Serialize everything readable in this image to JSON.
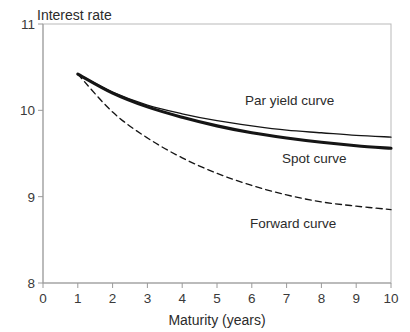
{
  "chart_data": {
    "type": "line",
    "title": "",
    "xlabel": "Maturity (years)",
    "ylabel": "Interest rate",
    "xlim": [
      0,
      10
    ],
    "ylim": [
      8,
      11
    ],
    "xticks": [
      "0",
      "1",
      "2",
      "3",
      "4",
      "5",
      "6",
      "7",
      "8",
      "9",
      "10"
    ],
    "yticks": [
      "8",
      "9",
      "10",
      "11"
    ],
    "grid": false,
    "legend_position": "inline-annotations",
    "x": [
      1,
      2,
      3,
      4,
      5,
      6,
      7,
      8,
      9,
      10
    ],
    "series": [
      {
        "name": "Par yield curve",
        "style": "thin-solid",
        "values": [
          10.42,
          10.21,
          10.06,
          9.96,
          9.88,
          9.82,
          9.77,
          9.74,
          9.71,
          9.69
        ]
      },
      {
        "name": "Spot curve",
        "style": "thick-solid",
        "values": [
          10.42,
          10.2,
          10.04,
          9.92,
          9.82,
          9.74,
          9.68,
          9.63,
          9.59,
          9.56
        ]
      },
      {
        "name": "Forward curve",
        "style": "dashed",
        "values": [
          10.42,
          9.98,
          9.68,
          9.45,
          9.27,
          9.13,
          9.02,
          8.94,
          8.89,
          8.85
        ]
      }
    ],
    "annotations": [
      {
        "text": "Par yield curve",
        "x_px": 245,
        "y_px": 105,
        "for_series": "Par yield curve"
      },
      {
        "text": "Spot curve",
        "x_px": 282,
        "y_px": 163,
        "for_series": "Spot curve"
      },
      {
        "text": "Forward curve",
        "x_px": 250,
        "y_px": 228,
        "for_series": "Forward curve"
      }
    ],
    "colors": {
      "curve": "#151515",
      "axis": "#9a9a9a",
      "frame": "#b9b9b9",
      "text": "#2b2b2b",
      "background": "#ffffff"
    }
  }
}
